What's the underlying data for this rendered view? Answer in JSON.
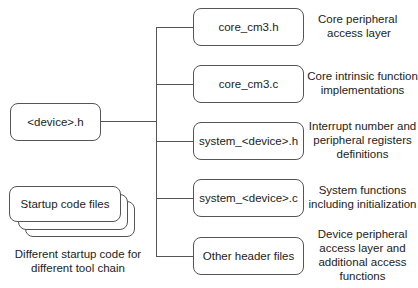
{
  "device_header": {
    "label": "<device>.h"
  },
  "files": [
    {
      "label": "core_cm3.h",
      "description": [
        "Core peripheral",
        "access layer"
      ]
    },
    {
      "label": "core_cm3.c",
      "description": [
        "Core intrinsic function",
        "implementations"
      ]
    },
    {
      "label": "system_<device>.h",
      "description": [
        "Interrupt number and",
        "peripheral registers",
        "definitions"
      ]
    },
    {
      "label": "system_<device>.c",
      "description": [
        "System functions",
        "including initialization"
      ]
    },
    {
      "label": "Other header files",
      "description": [
        "Device peripheral",
        "access layer and",
        "additional access",
        "functions"
      ]
    }
  ],
  "startup": {
    "label": "Startup code files",
    "caption": [
      "Different startup code for",
      "different tool chain"
    ]
  }
}
